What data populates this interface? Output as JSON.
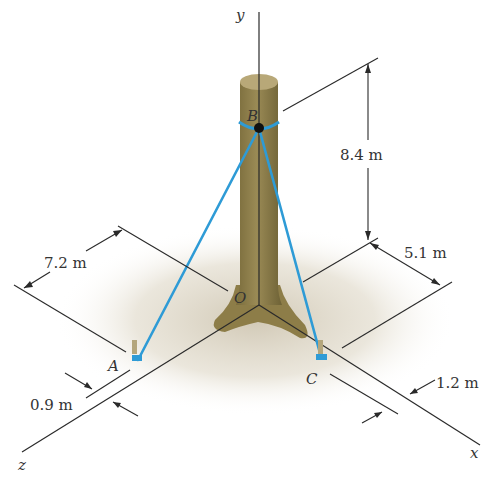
{
  "axes": {
    "x_label": "x",
    "y_label": "y",
    "z_label": "z",
    "origin_label": "O"
  },
  "points": {
    "A": "A",
    "B": "B",
    "C": "C"
  },
  "dimensions": {
    "height_B": "8.4 m",
    "z_offset_A": "7.2 m",
    "x_offset_C": "5.1 m",
    "A_offset_from_z": "0.9 m",
    "C_offset_from_x": "1.2 m"
  },
  "colors": {
    "cable": "#2e9bd6",
    "trunk": "#8a7a45",
    "trunk_top": "#b8a878",
    "ground_shadow": "#d8d0c0",
    "anchor": "#2e9bd6"
  }
}
